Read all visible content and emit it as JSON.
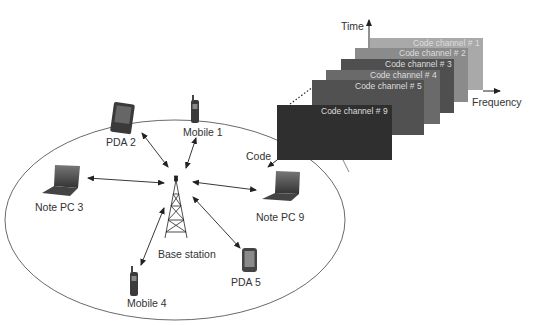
{
  "diagram": {
    "type": "cdma-cell-network",
    "axes": {
      "time": "Time",
      "frequency": "Frequency",
      "code": "Code"
    },
    "code_channels": [
      {
        "label": "Code channel # 1",
        "color": "#a9a9a9"
      },
      {
        "label": "Code channel # 2",
        "color": "#8b8b8b"
      },
      {
        "label": "Code channel # 3",
        "color": "#4f4f4f"
      },
      {
        "label": "Code channel # 4",
        "color": "#6a6a6a"
      },
      {
        "label": "Code channel # 5",
        "color": "#515151"
      },
      {
        "label": "Code channel # 9",
        "color": "#2f2f2f"
      }
    ],
    "base_station": {
      "label": "Base station"
    },
    "devices": [
      {
        "label": "Mobile 1",
        "kind": "mobile-phone"
      },
      {
        "label": "PDA 2",
        "kind": "pda"
      },
      {
        "label": "Note PC 3",
        "kind": "laptop"
      },
      {
        "label": "Mobile 4",
        "kind": "mobile-phone"
      },
      {
        "label": "PDA 5",
        "kind": "pda"
      },
      {
        "label": "Note PC 9",
        "kind": "laptop"
      }
    ]
  }
}
